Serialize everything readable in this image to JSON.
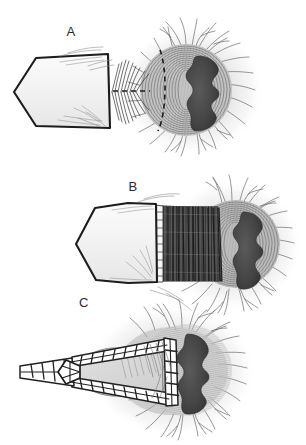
{
  "figure": {
    "background_color": "#ffffff",
    "ink_color": "#2a2a2a",
    "medium": "grayscale pen-and-ink / halftone scientific drawing",
    "panel_count": 3,
    "panels": [
      {
        "id": "A",
        "label": "A",
        "label_position": {
          "x": 71,
          "y": 36
        },
        "caption_text": "A",
        "stage": "instrument tip abutting the structure, dashed entry plane marked",
        "elements": {
          "instrument": {
            "name": "wedge-instrument",
            "shape": "pointed-wedge",
            "tip_direction": "left",
            "fill_color": "#f2f2f2",
            "outline_color": "#1c1c1c"
          },
          "target": {
            "name": "radial-tissue-mass",
            "halo_color": "#e4e4e4",
            "ring_color": "#8a8a8a",
            "core_color": "#4a4a4a",
            "fringe_color": "#707070",
            "features": [
              "concentric-rings",
              "dark-lobed-core",
              "radiating-fibers"
            ]
          },
          "dashed_plane": {
            "name": "dashed-entry-plane",
            "color": "#1c1c1c",
            "style": "dashed"
          },
          "hatching": {
            "name": "dense-hatch-zone",
            "color": "#3a3a3a"
          }
        }
      },
      {
        "id": "B",
        "label": "B",
        "label_position": {
          "x": 133,
          "y": 191
        },
        "caption_text": "B",
        "stage": "instrument advanced into a cylindrical barrel of dark striations",
        "elements": {
          "instrument": {
            "name": "wedge-instrument",
            "shape": "pointed-wedge",
            "tip_direction": "left",
            "fill_color": "#f2f2f2",
            "outline_color": "#1c1c1c"
          },
          "barrel": {
            "name": "striated-barrel",
            "fill_color": "#4f4f4f",
            "stripe_color": "#2b2b2b",
            "rim_color": "#fafafa"
          },
          "target": {
            "name": "radial-tissue-mass",
            "halo_color": "#e4e4e4",
            "ring_color": "#8a8a8a",
            "core_color": "#4a4a4a",
            "fringe_color": "#707070"
          }
        }
      },
      {
        "id": "C",
        "label": "C",
        "label_position": {
          "x": 84,
          "y": 307
        },
        "caption_text": "C",
        "stage": "mesh lattice scaffold deployed around the cavity",
        "elements": {
          "mesh": {
            "name": "lattice-mesh-scaffold",
            "fill_color": "#ffffff",
            "outline_color": "#222222",
            "pattern": "ladder-rungs",
            "shape": "tapered-pointed-loop"
          },
          "cavity": {
            "name": "inner-cavity",
            "fill_color": "#d8d8d8",
            "outline_color": "#6e6e6e"
          },
          "target": {
            "name": "radial-tissue-mass",
            "halo_color": "#e4e4e4",
            "core_color": "#4a4a4a",
            "fringe_color": "#707070"
          }
        }
      }
    ]
  }
}
